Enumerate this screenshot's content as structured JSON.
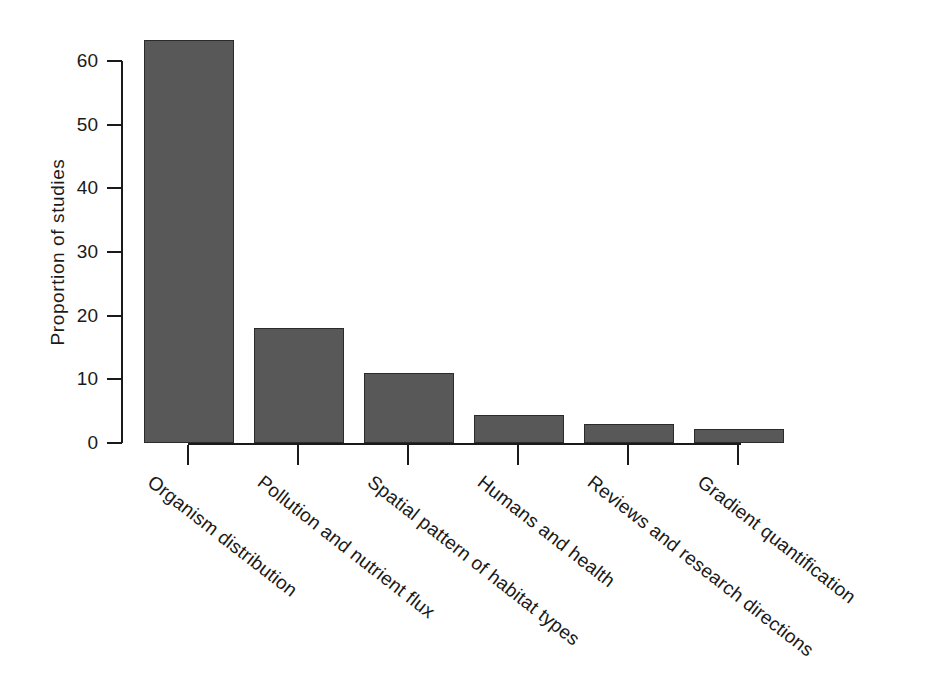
{
  "chart_data": {
    "type": "bar",
    "title": "",
    "subtitle": "",
    "xlabel": "",
    "ylabel": "Proportion of studies",
    "categories": [
      "Organism distribution",
      "Pollution and nutrient flux",
      "Spatial pattern of habitat types",
      "Humans and health",
      "Reviews and research directions",
      "Gradient quantification"
    ],
    "values": [
      63.3,
      18.1,
      11.0,
      4.4,
      3.0,
      2.2
    ],
    "ylim": [
      0,
      63.3
    ],
    "yticks": [
      0,
      10,
      20,
      30,
      40,
      50,
      60
    ],
    "ytick_labels": [
      "0",
      "10",
      "20",
      "30",
      "40",
      "50",
      "60"
    ],
    "grid": false,
    "legend": false,
    "legend_position": "none",
    "bar_color": "#585858",
    "bar_edge_color": "#2b2b2b",
    "axis_color": "#1a1a1a",
    "background": "#ffffff",
    "xtick_label_rotation": -38
  },
  "axes": {
    "y_title": "Proportion of studies"
  }
}
